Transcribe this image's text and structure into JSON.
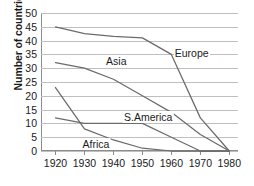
{
  "chart_data": {
    "type": "line",
    "title": "",
    "subtitle": "",
    "xlabel": "",
    "ylabel": "Number of countries",
    "x": [
      1920,
      1930,
      1940,
      1950,
      1960,
      1970,
      1980
    ],
    "xlim": [
      1915,
      1983
    ],
    "ylim": [
      0,
      50
    ],
    "ytick_step": 5,
    "yticks": [
      0,
      5,
      10,
      15,
      20,
      25,
      30,
      35,
      40,
      45,
      50
    ],
    "xticks": [
      "1920",
      "1930",
      "1940",
      "1950",
      "1960",
      "1970",
      "1980"
    ],
    "grid": "horizontal",
    "legend": "inline-labels",
    "line_color": "#6b6b6b",
    "grid_color": "#bfbfbf",
    "axis_color": "#8c8c8c",
    "series": [
      {
        "name": "Europe",
        "label": "Europe",
        "values": [
          45,
          42.5,
          41.5,
          41,
          35,
          12,
          0
        ],
        "label_x": 1967,
        "label_y": 35.5
      },
      {
        "name": "Asia",
        "label": "Asia",
        "values": [
          32,
          30,
          26,
          20,
          14,
          6,
          0
        ],
        "label_x": 1941,
        "label_y": 32.5
      },
      {
        "name": "S.America",
        "label": "S.America",
        "values": [
          12,
          10,
          10,
          10,
          5,
          0,
          0
        ],
        "label_x": 1952,
        "label_y": 12.5
      },
      {
        "name": "Africa",
        "label": "Africa",
        "values": [
          23,
          8,
          4,
          1,
          0,
          0,
          0
        ],
        "label_x": 1934,
        "label_y": 2.5
      }
    ]
  }
}
